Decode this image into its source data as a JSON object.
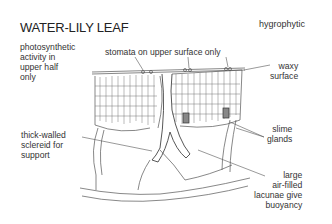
{
  "title": "WATER-LILY LEAF",
  "category": "hygrophytic",
  "labels": {
    "photosynthetic": "photosynthetic\nactivity in\nupper half\nonly",
    "stomata": "stomata on upper surface only",
    "waxy": "waxy\nsurface",
    "sclereid": "thick-walled\nsclereid for\nsupport",
    "slime": "slime\nglands",
    "lacunae": "large\nair-filled\nlacunae give\nbuoyancy"
  },
  "colors": {
    "line": "#555555",
    "text": "#333333",
    "background": "#ffffff"
  }
}
